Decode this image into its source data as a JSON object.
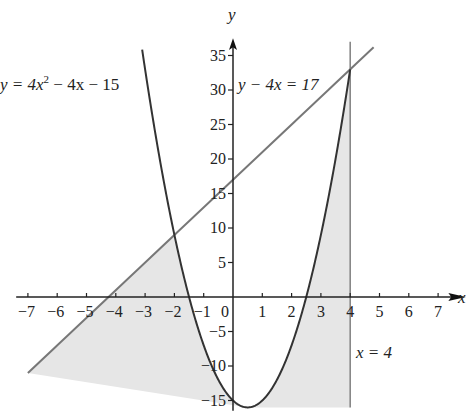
{
  "chart_data": {
    "type": "line",
    "title": "",
    "xlabel": "x",
    "ylabel": "y",
    "xlim": [
      -7,
      7
    ],
    "ylim": [
      -16,
      36
    ],
    "grid": false,
    "x_ticks": [
      -7,
      -6,
      -5,
      -4,
      -3,
      -2,
      -1,
      0,
      1,
      2,
      3,
      4,
      5,
      6,
      7
    ],
    "y_ticks": [
      -15,
      -10,
      -5,
      5,
      10,
      15,
      20,
      25,
      30,
      35
    ],
    "x_tick_labels": [
      "−7",
      "−6",
      "−5",
      "−4",
      "−3",
      "−2",
      "−1",
      "0",
      "1",
      "2",
      "3",
      "4",
      "5",
      "6",
      "7"
    ],
    "y_tick_labels": [
      "−15",
      "−10",
      "−5",
      "5",
      "10",
      "15",
      "20",
      "25",
      "30",
      "35"
    ],
    "series": [
      {
        "name": "y = 4x² − 4x − 15",
        "kind": "parabola",
        "equation": "y = 4x^2 - 4x - 15",
        "x_range": [
          -3.1,
          4
        ],
        "vertex": [
          0.5,
          -16
        ],
        "roots": [
          -1.5,
          2.5
        ],
        "color": "#333333"
      },
      {
        "name": "y − 4x = 17",
        "kind": "line",
        "equation": "y = 4x + 17",
        "x_range": [
          -7,
          4.8
        ],
        "color": "#777777"
      },
      {
        "name": "x = 4",
        "kind": "vertical",
        "x": 4,
        "y_range": [
          -16,
          37
        ],
        "color": "#888888"
      }
    ],
    "shaded_region": {
      "color": "#e6e6e6",
      "description": "Region bounded by the line y = 4x + 17, the parabola, the line x = 4, and a lower boundary from (-7,-11) to (4,-16); the parabola's interior between the curve and line is unshaded"
    },
    "intersections": [
      [
        -2,
        9
      ],
      [
        4,
        33
      ]
    ],
    "annotations": [
      {
        "text": "y = 4x² − 4x − 15",
        "position": "upper-left"
      },
      {
        "text": "y − 4x = 17",
        "position": "near y=30 right of y-axis"
      },
      {
        "text": "x = 4",
        "position": "right of x=4 line below x-axis"
      }
    ]
  },
  "labels": {
    "axis_x": "x",
    "axis_y": "y",
    "origin": "0",
    "parabola_eq_prefix": "y = 4x",
    "parabola_eq_exp": "2",
    "parabola_eq_suffix": " − 4x − 15",
    "line_eq": "y − 4x = 17",
    "vertical_eq": "x = 4"
  }
}
